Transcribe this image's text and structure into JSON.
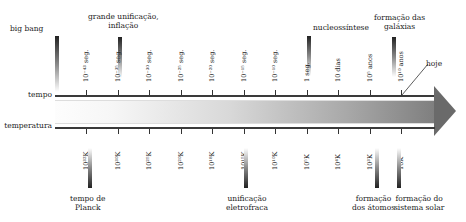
{
  "axes": {
    "time_label": "tempo",
    "temperature_label": "temperatura"
  },
  "time_ticks": [
    "10⁻⁴³ seg.",
    "10⁻³⁵ seg.",
    "10⁻³⁰ seg.",
    "10⁻²⁵ seg.",
    "10⁻²⁰ seg.",
    "10⁻¹⁵ seg.",
    "10⁻¹⁰ seg.",
    "1 seg.",
    "10 dias",
    "10⁵ anos",
    "10¹⁰ anos"
  ],
  "temperature_ticks": [
    "10³²K",
    "10³⁰K",
    "10²⁵K",
    "10²⁰K",
    "10¹⁸K",
    "10¹⁵K",
    "10¹⁰K",
    "10⁵K",
    "10⁴K",
    "10³K",
    "10K"
  ],
  "top_events": [
    {
      "label": "big bang"
    },
    {
      "label": "grande unificação,\ninflação"
    },
    {
      "label": "nucleossíntese"
    },
    {
      "label": "formação das\ngaláxias"
    },
    {
      "label": "hoje"
    }
  ],
  "bottom_events": [
    {
      "label": "tempo de\nPlanck"
    },
    {
      "label": "unificação\neletrofraca"
    },
    {
      "label": "formação\ndos átomos"
    },
    {
      "label": "formação do\nsistema solar"
    }
  ]
}
